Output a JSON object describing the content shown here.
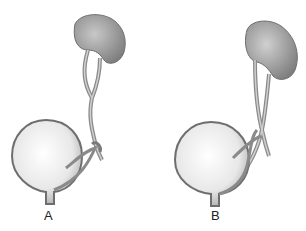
{
  "figure": {
    "panels": [
      {
        "id": "A",
        "label": "A",
        "description": "Kidney with bifid ureter joining before bladder"
      },
      {
        "id": "B",
        "label": "B",
        "description": "Kidney with duplicated ureters entering bladder separately"
      }
    ]
  },
  "colors": {
    "background": "#ffffff",
    "organ_fill": "#9a9a9a",
    "organ_light": "#d8d8d8",
    "bladder_fill": "#eeeeee",
    "outline": "#6e6e6e"
  }
}
